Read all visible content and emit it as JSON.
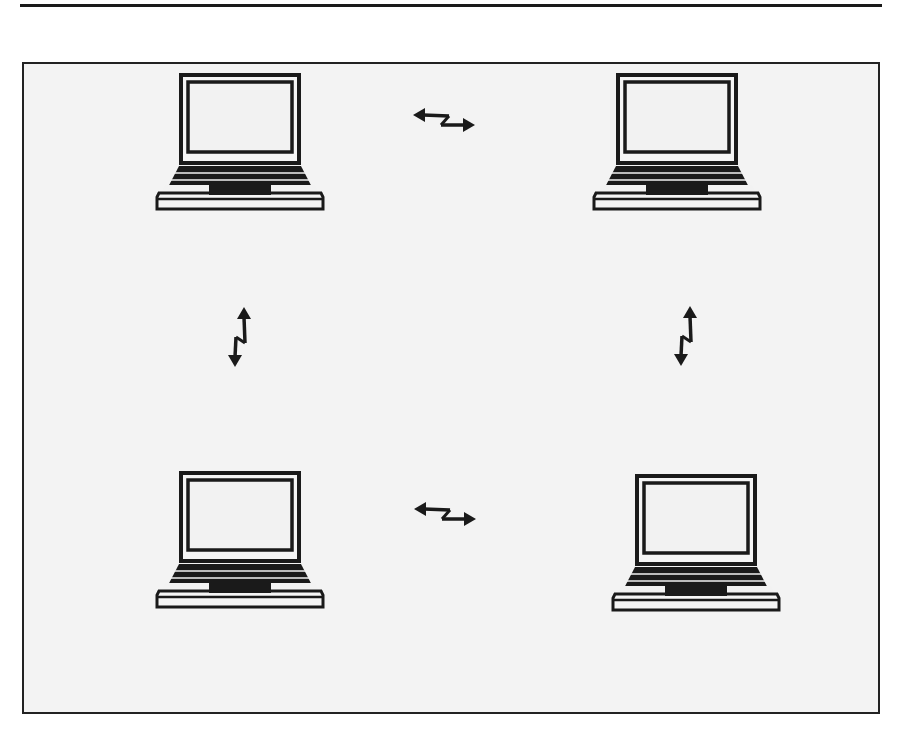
{
  "diagram": {
    "type": "peer-to-peer network",
    "colors": {
      "background": "#f3f3f3",
      "stroke": "#1a1a1a",
      "page": "#ffffff"
    },
    "nodes": [
      {
        "id": "laptop-top-left",
        "icon": "laptop-icon",
        "position": "top-left"
      },
      {
        "id": "laptop-top-right",
        "icon": "laptop-icon",
        "position": "top-right"
      },
      {
        "id": "laptop-bottom-left",
        "icon": "laptop-icon",
        "position": "bottom-left"
      },
      {
        "id": "laptop-bottom-right",
        "icon": "laptop-icon",
        "position": "bottom-right"
      }
    ],
    "links": [
      {
        "from": "laptop-top-left",
        "to": "laptop-top-right",
        "icon": "bidirectional-wireless-arrow-icon",
        "orientation": "horizontal"
      },
      {
        "from": "laptop-bottom-left",
        "to": "laptop-bottom-right",
        "icon": "bidirectional-wireless-arrow-icon",
        "orientation": "horizontal"
      },
      {
        "from": "laptop-top-left",
        "to": "laptop-bottom-left",
        "icon": "bidirectional-wireless-arrow-icon",
        "orientation": "vertical"
      },
      {
        "from": "laptop-top-right",
        "to": "laptop-bottom-right",
        "icon": "bidirectional-wireless-arrow-icon",
        "orientation": "vertical"
      }
    ]
  }
}
